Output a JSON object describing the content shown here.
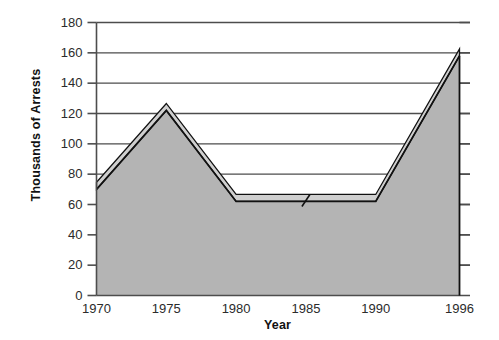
{
  "chart_data": {
    "type": "area",
    "title": "",
    "xlabel": "Year",
    "ylabel": "Thousands of Arrests",
    "x": [
      1970,
      1975,
      1980,
      1985,
      1990,
      1996
    ],
    "categories": [
      "1970",
      "1975",
      "1980",
      "1985",
      "1990",
      "1996"
    ],
    "values": [
      70,
      122,
      62,
      62,
      62,
      158
    ],
    "series": [
      {
        "name": "Arrests",
        "values": [
          70,
          122,
          62,
          62,
          62,
          158
        ]
      }
    ],
    "xlim": [
      1970,
      1996
    ],
    "ylim": [
      0,
      180
    ],
    "ytick_labels": [
      "0",
      "20",
      "40",
      "60",
      "80",
      "100",
      "120",
      "140",
      "160",
      "180"
    ],
    "ytick_values": [
      0,
      20,
      40,
      60,
      80,
      100,
      120,
      140,
      160,
      180
    ],
    "xtick_labels": [
      "1970",
      "1975",
      "1980",
      "1985",
      "1990",
      "1996"
    ],
    "grid": "horizontal",
    "legend": "none",
    "fill_color": "#b4b4b4",
    "highlight_color": "#cfcfcf",
    "line_color": "#111111",
    "axis_color": "#4d4d4d",
    "grid_color": "#4d4d4d",
    "background_color": "#ffffff"
  },
  "axes": {
    "y_title": "Thousands of Arrests",
    "x_title": "Year"
  }
}
